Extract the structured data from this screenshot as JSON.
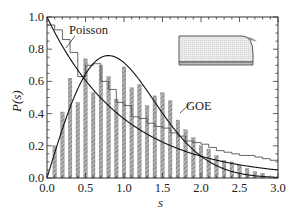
{
  "chart_data": {
    "type": "bar",
    "title": "",
    "xlabel": "s",
    "ylabel": "P(s)",
    "xlim": [
      0.0,
      3.0
    ],
    "ylim": [
      0.0,
      1.0
    ],
    "x_ticks": [
      "0.0",
      "0.5",
      "1.0",
      "1.5",
      "2.0",
      "2.5",
      "3.0"
    ],
    "y_ticks": [
      "0.0",
      "0.2",
      "0.4",
      "0.6",
      "0.8",
      "1.0"
    ],
    "grid": false,
    "annotations": [
      {
        "text": "Poisson",
        "target": "Poisson curve / step histogram"
      },
      {
        "text": "GOE",
        "target": "GOE Wigner curve"
      }
    ],
    "inset": "rounded billiard shape (quarter-stadium)",
    "series": [
      {
        "name": "Hatched histogram (bars)",
        "x": [
          0.1,
          0.2,
          0.3,
          0.4,
          0.5,
          0.6,
          0.7,
          0.8,
          0.9,
          1.0,
          1.1,
          1.2,
          1.3,
          1.4,
          1.5,
          1.6,
          1.7,
          1.8,
          1.9,
          2.0,
          2.1,
          2.2,
          2.3,
          2.4,
          2.5,
          2.6,
          2.7,
          2.8
        ],
        "values": [
          0.2,
          0.41,
          0.62,
          0.47,
          0.74,
          0.53,
          0.7,
          0.63,
          0.49,
          0.69,
          0.56,
          0.58,
          0.45,
          0.51,
          0.53,
          0.48,
          0.36,
          0.3,
          0.25,
          0.2,
          0.18,
          0.14,
          0.11,
          0.1,
          0.08,
          0.06,
          0.04,
          0.03
        ]
      },
      {
        "name": "Step histogram (open)",
        "x": [
          0.0,
          0.1,
          0.2,
          0.3,
          0.4,
          0.5,
          0.6,
          0.7,
          0.8,
          0.9,
          1.0,
          1.1,
          1.2,
          1.3,
          1.4,
          1.5,
          1.6,
          1.7,
          1.8,
          1.9,
          2.0,
          2.1,
          2.2,
          2.3,
          2.4,
          2.5,
          2.6,
          2.7,
          2.8,
          2.9
        ],
        "values": [
          0.95,
          0.92,
          0.86,
          0.78,
          0.63,
          0.7,
          0.71,
          0.6,
          0.55,
          0.47,
          0.45,
          0.38,
          0.37,
          0.34,
          0.32,
          0.31,
          0.28,
          0.26,
          0.23,
          0.22,
          0.21,
          0.19,
          0.17,
          0.16,
          0.15,
          0.14,
          0.14,
          0.13,
          0.12,
          0.11
        ]
      },
      {
        "name": "Poisson",
        "formula": "exp(-s)"
      },
      {
        "name": "GOE",
        "formula": "(pi/2) s exp(-pi s^2/4)"
      }
    ]
  },
  "labels": {
    "poisson": "Poisson",
    "goe": "GOE",
    "xlabel": "s",
    "ylabel": "P(s)"
  }
}
